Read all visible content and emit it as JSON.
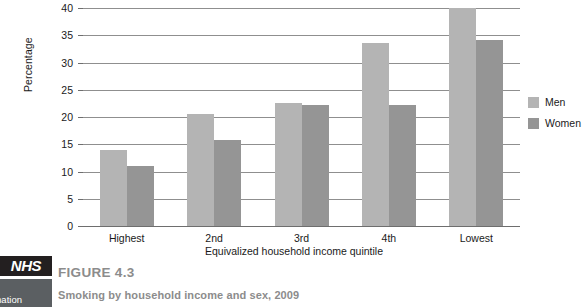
{
  "chart_data": {
    "type": "bar",
    "title": "",
    "xlabel": "Equivalized household income quintile",
    "ylabel": "Percentage",
    "categories": [
      "Highest",
      "2nd",
      "3rd",
      "4th",
      "Lowest"
    ],
    "series": [
      {
        "name": "Men",
        "color": "#b4b4b4",
        "values": [
          14,
          20.6,
          22.6,
          33.5,
          40
        ]
      },
      {
        "name": "Women",
        "color": "#959595",
        "values": [
          11,
          15.8,
          22.2,
          22.2,
          34.2
        ]
      }
    ],
    "ylim": [
      0,
      40
    ],
    "ytick_step": 5,
    "yticks": [
      0,
      5,
      10,
      15,
      20,
      25,
      30,
      35,
      40
    ],
    "ytick_labels": [
      "0",
      "5",
      "10",
      "15",
      "20",
      "25",
      "30",
      "35",
      "40"
    ],
    "grid": true,
    "legend_position": "right"
  },
  "legend": {
    "items": [
      {
        "label": "Men",
        "color": "#b4b4b4"
      },
      {
        "label": "Women",
        "color": "#959595"
      }
    ]
  },
  "caption": {
    "figure_number": "FIGURE 4.3",
    "figure_title": "Smoking by household income and sex, 2009"
  },
  "logo": {
    "mark_text": "NHS",
    "sub_line_1": "e",
    "sub_line_2": "ormation"
  }
}
